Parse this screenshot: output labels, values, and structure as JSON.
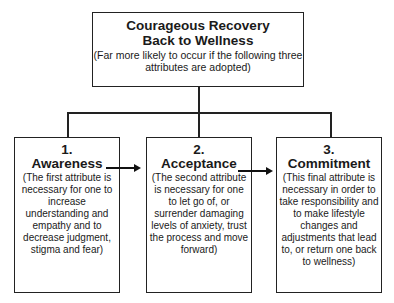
{
  "diagram": {
    "top": {
      "title_line1": "Courageous Recovery",
      "title_line2": "Back to Wellness",
      "subtitle": "(Far more likely to occur if the following three attributes are adopted)"
    },
    "steps": [
      {
        "number": "1.",
        "name": "Awareness",
        "description": "(The first attribute is necessary for one to increase understanding and empathy and to decrease judgment, stigma and fear)"
      },
      {
        "number": "2.",
        "name": "Acceptance",
        "description": "(The second attribute is necessary for one to let go of, or surrender damaging levels of anxiety, trust the process and move forward)"
      },
      {
        "number": "3.",
        "name": "Commitment",
        "description": "(This final attribute is necessary in order to take responsibility and to make lifestyle changes and adjustments that lead to, or return one back to wellness)"
      }
    ],
    "edges": [
      {
        "from": "top",
        "to": "1"
      },
      {
        "from": "top",
        "to": "2"
      },
      {
        "from": "top",
        "to": "3"
      },
      {
        "from": "1",
        "to": "2",
        "type": "arrow"
      },
      {
        "from": "2",
        "to": "3",
        "type": "arrow"
      }
    ]
  }
}
